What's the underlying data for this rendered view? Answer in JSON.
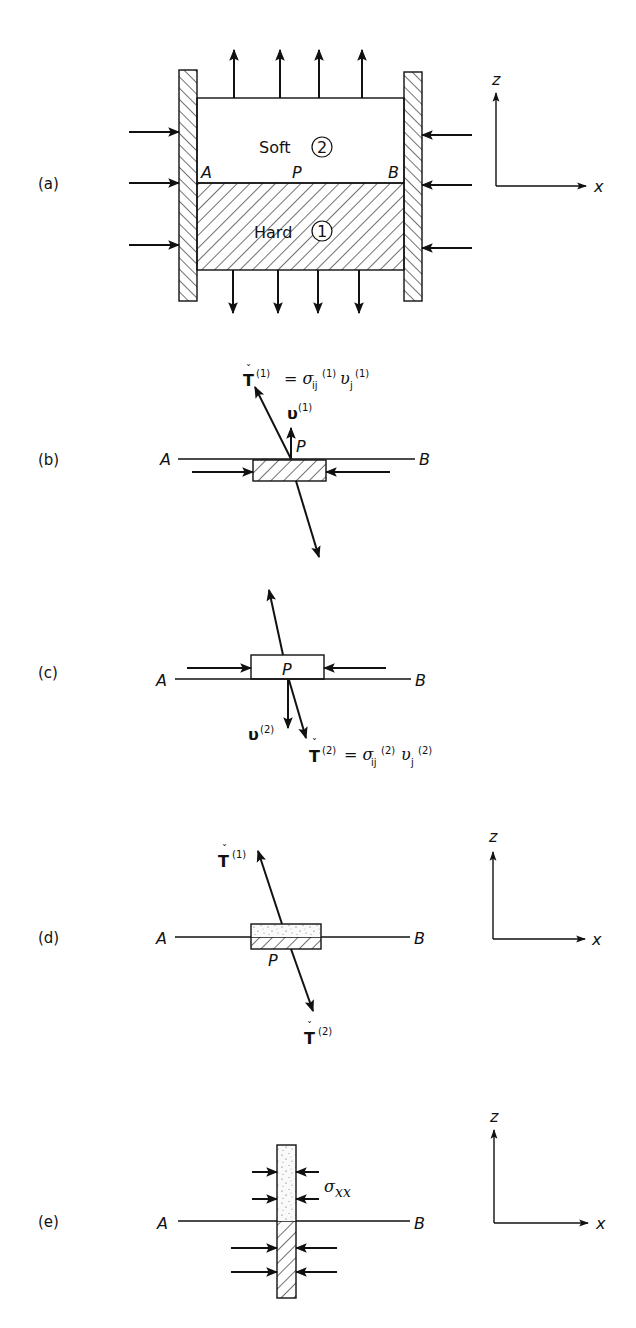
{
  "figure": {
    "panels": [
      {
        "id": "a",
        "label": "(a)",
        "materials": {
          "top": {
            "name": "Soft",
            "number": "2",
            "pattern": "stipple"
          },
          "bottom": {
            "name": "Hard",
            "number": "1",
            "pattern": "hatch"
          }
        },
        "points": {
          "left": "A",
          "middle": "P",
          "right": "B"
        }
      },
      {
        "id": "b",
        "label": "(b)",
        "points": {
          "left": "A",
          "middle": "P",
          "right": "B"
        },
        "traction_symbol": "T",
        "traction_superscript": "(1)",
        "equation_rhs": "= σ",
        "sigma_sub": "ij",
        "sigma_sup": "(1)",
        "nu_symbol": "υ",
        "nu_sub": "j",
        "nu_sup": "(1)",
        "normal_label": "υ",
        "normal_sup": "(1)"
      },
      {
        "id": "c",
        "label": "(c)",
        "points": {
          "left": "A",
          "middle": "P",
          "right": "B"
        },
        "traction_symbol": "T",
        "traction_superscript": "(2)",
        "equation_rhs": "= σ",
        "sigma_sub": "ij",
        "sigma_sup": "(2)",
        "nu_symbol": "υ",
        "nu_sub": "j",
        "nu_sup": "(2)",
        "normal_label": "υ",
        "normal_sup": "(2)"
      },
      {
        "id": "d",
        "label": "(d)",
        "points": {
          "left": "A",
          "middle": "P",
          "right": "B"
        },
        "upper_traction": "T",
        "upper_sup": "(1)",
        "lower_traction": "T",
        "lower_sup": "(2)"
      },
      {
        "id": "e",
        "label": "(e)",
        "points": {
          "left": "A",
          "right": "B"
        },
        "stress_symbol": "σ",
        "stress_sub": "xx"
      }
    ],
    "axes": {
      "vertical": "z",
      "horizontal": "x"
    },
    "accent_check": "ˇ"
  }
}
